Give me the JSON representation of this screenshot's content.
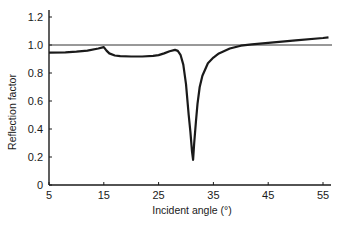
{
  "chart_data": {
    "type": "line",
    "title": "",
    "xlabel": "Incident angle (°)",
    "ylabel": "Reflection factor",
    "xlim": [
      5,
      56.5
    ],
    "ylim": [
      0,
      1.27
    ],
    "x_ticks": [
      5,
      15,
      25,
      35,
      45,
      55
    ],
    "x_tick_labels": [
      "5",
      "15",
      "25",
      "35",
      "45",
      "55"
    ],
    "y_ticks": [
      0,
      0.2,
      0.4,
      0.6,
      0.8,
      1.0,
      1.2
    ],
    "y_tick_labels": [
      "0",
      "0.2",
      "0.4",
      "0.6",
      "0.8",
      "1.0",
      "1.2"
    ],
    "grid": false,
    "legend": null,
    "reference_line": {
      "y": 1.0,
      "x_range": [
        5,
        56.5
      ]
    },
    "series": [
      {
        "name": "Reflection factor",
        "x": [
          5,
          8,
          10,
          12,
          14,
          15,
          15.5,
          16,
          17,
          18,
          20,
          22,
          24,
          25,
          26,
          27,
          28,
          28.5,
          29,
          29.5,
          30,
          30.5,
          30.8,
          31.1,
          31.3,
          31.5,
          31.8,
          32.1,
          32.5,
          33,
          34,
          35,
          36,
          38,
          40,
          42,
          45,
          50,
          55,
          56
        ],
        "values": [
          0.945,
          0.948,
          0.952,
          0.96,
          0.975,
          0.985,
          0.96,
          0.94,
          0.925,
          0.92,
          0.918,
          0.918,
          0.922,
          0.928,
          0.94,
          0.955,
          0.965,
          0.958,
          0.93,
          0.86,
          0.72,
          0.5,
          0.38,
          0.24,
          0.18,
          0.3,
          0.45,
          0.58,
          0.7,
          0.78,
          0.87,
          0.91,
          0.94,
          0.975,
          0.995,
          1.005,
          1.015,
          1.033,
          1.05,
          1.055
        ]
      }
    ]
  }
}
